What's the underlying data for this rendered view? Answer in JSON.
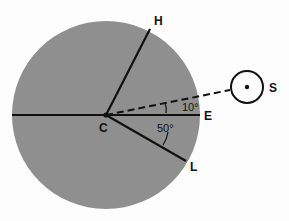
{
  "diagram": {
    "colors": {
      "disk": "#8f8f8f",
      "lines": "#111111",
      "background": "#fdfdfd",
      "sun_fill": "#ffffff"
    },
    "labels": {
      "center": "C",
      "horizon_point": "H",
      "east_point": "E",
      "lower_point": "L",
      "sun": "S"
    },
    "angles": {
      "sun_above_E": "10°",
      "L_below_sun": "50°"
    }
  }
}
